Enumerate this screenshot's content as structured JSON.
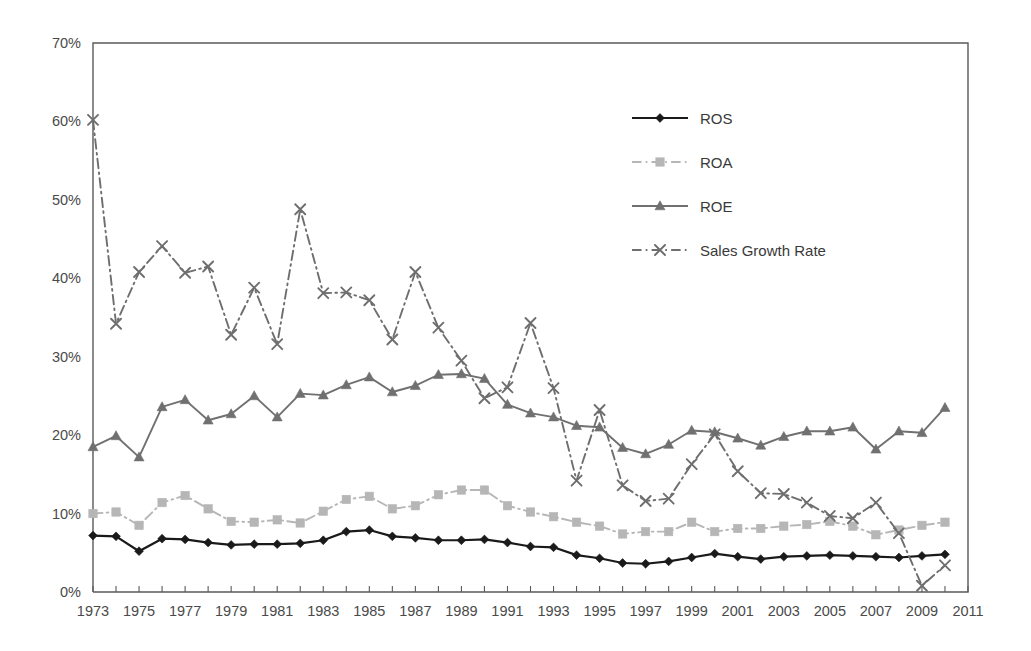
{
  "chart_data": {
    "type": "line",
    "title": "",
    "subtitle": "",
    "xlabel": "",
    "ylabel": "",
    "xlim": [
      1973,
      2011
    ],
    "ylim": [
      0,
      70
    ],
    "y_tick_labels": [
      "0%",
      "10%",
      "20%",
      "30%",
      "40%",
      "50%",
      "60%",
      "70%"
    ],
    "y_tick_values": [
      0,
      10,
      20,
      30,
      40,
      50,
      60,
      70
    ],
    "x_tick_labels": [
      "1973",
      "1975",
      "1977",
      "1979",
      "1981",
      "1983",
      "1985",
      "1987",
      "1989",
      "1991",
      "1993",
      "1995",
      "1997",
      "1999",
      "2001",
      "2003",
      "2005",
      "2007",
      "2009",
      "2011"
    ],
    "x_minor_tick_step": 1,
    "x_label_step": 2,
    "grid": false,
    "legend_position": "upper-right",
    "units": "percent",
    "x": [
      1973,
      1974,
      1975,
      1976,
      1977,
      1978,
      1979,
      1980,
      1981,
      1982,
      1983,
      1984,
      1985,
      1986,
      1987,
      1988,
      1989,
      1990,
      1991,
      1992,
      1993,
      1994,
      1995,
      1996,
      1997,
      1998,
      1999,
      2000,
      2001,
      2002,
      2003,
      2004,
      2005,
      2006,
      2007,
      2008,
      2009,
      2010
    ],
    "series": [
      {
        "name": "ROS",
        "color": "#1a1a1a",
        "marker": "diamond",
        "linestyle": "solid",
        "values": [
          7.2,
          7.1,
          5.2,
          6.8,
          6.7,
          6.3,
          6.0,
          6.1,
          6.1,
          6.2,
          6.6,
          7.7,
          7.9,
          7.1,
          6.9,
          6.6,
          6.6,
          6.7,
          6.3,
          5.8,
          5.7,
          4.7,
          4.3,
          3.7,
          3.6,
          3.9,
          4.4,
          4.9,
          4.5,
          4.2,
          4.5,
          4.6,
          4.7,
          4.6,
          4.5,
          4.4,
          4.6,
          4.8
        ]
      },
      {
        "name": "ROA",
        "color": "#b6b6b6",
        "marker": "square",
        "linestyle": "dashdot",
        "values": [
          10.0,
          10.2,
          8.5,
          11.4,
          12.3,
          10.6,
          9.0,
          8.9,
          9.2,
          8.8,
          10.3,
          11.8,
          12.2,
          10.6,
          11.0,
          12.4,
          13.0,
          13.0,
          11.0,
          10.2,
          9.6,
          8.9,
          8.4,
          7.4,
          7.7,
          7.7,
          8.9,
          7.7,
          8.1,
          8.1,
          8.4,
          8.6,
          9.0,
          8.4,
          7.3,
          7.9,
          8.5,
          8.9
        ]
      },
      {
        "name": "ROE",
        "color": "#707070",
        "marker": "triangle",
        "linestyle": "solid",
        "values": [
          18.5,
          19.9,
          17.2,
          23.6,
          24.5,
          21.9,
          22.7,
          25.0,
          22.3,
          25.3,
          25.1,
          26.4,
          27.4,
          25.5,
          26.3,
          27.7,
          27.8,
          27.2,
          23.9,
          22.8,
          22.3,
          21.2,
          21.0,
          18.4,
          17.6,
          18.8,
          20.6,
          20.4,
          19.6,
          18.7,
          19.8,
          20.5,
          20.5,
          21.0,
          18.2,
          20.5,
          20.3,
          23.5
        ]
      },
      {
        "name": "Sales Growth Rate",
        "color": "#6e6e6e",
        "marker": "x",
        "linestyle": "dashdot",
        "values": [
          60.2,
          34.2,
          40.8,
          44.1,
          40.7,
          41.5,
          32.8,
          38.8,
          31.6,
          48.8,
          38.1,
          38.2,
          37.2,
          32.2,
          40.8,
          33.7,
          29.5,
          24.7,
          26.1,
          34.3,
          26.0,
          14.2,
          23.2,
          13.6,
          11.6,
          11.9,
          16.3,
          20.1,
          15.4,
          12.6,
          12.5,
          11.4,
          9.7,
          9.4,
          11.4,
          7.5,
          0.8,
          3.4
        ]
      }
    ]
  },
  "legend": {
    "items": [
      {
        "label": "ROS"
      },
      {
        "label": "ROA"
      },
      {
        "label": "ROE"
      },
      {
        "label": "Sales Growth Rate"
      }
    ]
  },
  "colors": {
    "axis": "#5a5a5a",
    "background": "#ffffff",
    "ros": "#1a1a1a",
    "roa": "#b6b6b6",
    "roe": "#707070",
    "sales": "#6e6e6e"
  }
}
